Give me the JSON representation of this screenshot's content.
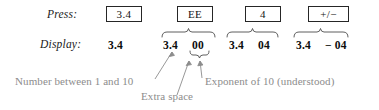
{
  "figure": {
    "rows": {
      "press_label": "Press:",
      "display_label": "Display:"
    },
    "keys": [
      {
        "name": "key-3-4",
        "label": "3.4"
      },
      {
        "name": "key-ee",
        "label": "EE"
      },
      {
        "name": "key-4",
        "label": "4"
      },
      {
        "name": "key-sign",
        "label": "+/−"
      }
    ],
    "display_steps": [
      {
        "name": "display-step-1",
        "mantissa": "3.4",
        "exponent": ""
      },
      {
        "name": "display-step-2",
        "mantissa": "3.4",
        "exponent": "00"
      },
      {
        "name": "display-step-3",
        "mantissa": "3.4",
        "exponent": "04"
      },
      {
        "name": "display-step-4",
        "mantissa": "3.4",
        "exponent": "− 04"
      }
    ],
    "annotations": [
      {
        "name": "annotation-mantissa",
        "text": "Number between 1 and 10"
      },
      {
        "name": "annotation-exponent",
        "text": "Exponent of 10 (understood)"
      },
      {
        "name": "annotation-extra-space",
        "text": "Extra space"
      }
    ],
    "colors": {
      "ink": "#1a1a1a",
      "annotation": "#8c8c8c",
      "rule": "#262626",
      "background": "#ffffff"
    }
  }
}
